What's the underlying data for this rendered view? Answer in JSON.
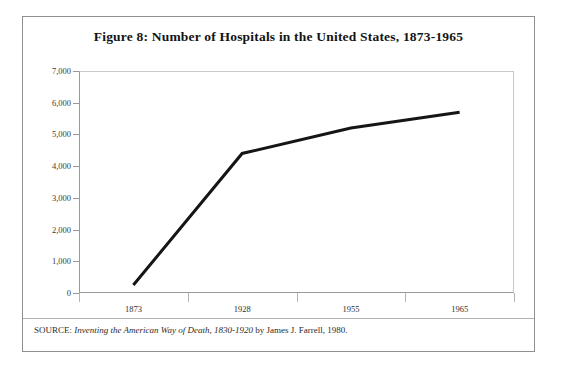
{
  "figure": {
    "title": "Figure 8: Number of Hospitals in the United States, 1873-1965",
    "source_prefix": "SOURCE: ",
    "source_title": "Inventing the American Way of Death, 1830-1920",
    "source_suffix": " by James J. Farrell, 1980."
  },
  "colors": {
    "line": "#151515",
    "frame": "#8f8f8f",
    "axis": "#9a9a9a",
    "grid": "#c9c9c9",
    "text": "#1a1a1a"
  },
  "chart_data": {
    "type": "line",
    "title": "Figure 8: Number of Hospitals in the United States, 1873-1965",
    "xlabel": "",
    "ylabel": "",
    "categories": [
      "1873",
      "1928",
      "1955",
      "1965"
    ],
    "values": [
      250,
      4400,
      5200,
      5700
    ],
    "series": [
      {
        "name": "Number of Hospitals",
        "values": [
          250,
          4400,
          5200,
          5700
        ]
      }
    ],
    "ylim": [
      0,
      7000
    ],
    "ytick_step": 1000,
    "ytick_labels": [
      "0",
      "1,000",
      "2,000",
      "3,000",
      "4,000",
      "5,000",
      "6,000",
      "7,000"
    ],
    "ytick_values": [
      0,
      1000,
      2000,
      3000,
      4000,
      5000,
      6000,
      7000
    ],
    "xtick_labels": [
      "1873",
      "1928",
      "1955",
      "1965"
    ],
    "grid": false,
    "legend": "none",
    "line_color": "#151515",
    "line_width": 3,
    "markers": false
  }
}
